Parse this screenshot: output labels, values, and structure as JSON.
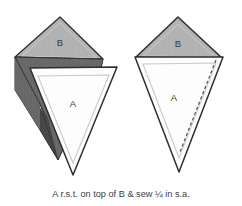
{
  "figure": {
    "caption": "A r.s.t. on top of B & sew ¼ in s.a.",
    "background_color": "#ffffff",
    "outline_color": "#2e2e2e",
    "inner_guide_color": "#c9c9c9",
    "fabric_right_side_color": "#b5b5b5",
    "fabric_wrong_side_color": "#6b6b6b",
    "fabric_wrong_side_dark_color": "#4a4a4a",
    "white_fabric_color": "#fdfdfd",
    "stitch_line_color": "#7a7a7a"
  },
  "left_figure": {
    "name": "pieces-stacked-offset",
    "pieces": [
      {
        "id": "B",
        "label": "B",
        "label_x": 60,
        "label_y": 43,
        "orientation": "point-up",
        "fill": "#b5b5b5",
        "description": "Triangle B right side up, rotated behind A"
      },
      {
        "id": "A",
        "label": "A",
        "label_x": 92,
        "label_y": 105,
        "orientation": "point-down",
        "fill": "#fdfdfd",
        "description": "Triangle A white, point down, placed on top of B"
      }
    ]
  },
  "right_figure": {
    "name": "pieces-aligned",
    "pieces": [
      {
        "id": "B",
        "label": "B",
        "label_x": 178,
        "label_y": 44,
        "orientation": "point-up",
        "fill": "#b5b5b5",
        "description": "Triangle B right side up, top edges aligned"
      },
      {
        "id": "A",
        "label": "A",
        "label_x": 172,
        "label_y": 98,
        "orientation": "point-down",
        "fill": "#fdfdfd",
        "description": "Triangle A white, point down, aligned on B"
      }
    ],
    "stitch_line": {
      "name": "seam-stitch-line",
      "style": "dashed",
      "description": "Dashed stitching line along right edge"
    }
  }
}
